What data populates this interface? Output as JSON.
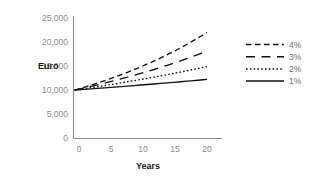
{
  "chart_data": {
    "type": "line",
    "title": "",
    "subtitle": "",
    "xlabel": "Years",
    "ylabel": "Euro",
    "x": [
      0,
      1,
      2,
      3,
      4,
      5,
      6,
      7,
      8,
      9,
      10,
      11,
      12,
      13,
      14,
      15,
      16,
      17,
      18,
      19,
      20
    ],
    "xlim": [
      0,
      20
    ],
    "ylim": [
      0,
      25000
    ],
    "x_ticks": [
      0,
      5,
      10,
      15,
      20
    ],
    "x_tick_labels": [
      "0",
      "5",
      "10",
      "15",
      "20"
    ],
    "y_ticks": [
      0,
      5000,
      10000,
      15000,
      20000,
      25000
    ],
    "y_tick_labels": [
      "0",
      "5,000",
      "10,000",
      "15,000",
      "20,000",
      "25,000"
    ],
    "grid": false,
    "legend_position": "right",
    "series": [
      {
        "name": "4%",
        "line_style": "dashed",
        "color": "#111111",
        "values": [
          10000,
          10400,
          10816,
          11249,
          11699,
          12167,
          12653,
          13159,
          13686,
          14233,
          14802,
          15395,
          16010,
          16651,
          17317,
          18009,
          18730,
          19479,
          20258,
          21068,
          21911
        ]
      },
      {
        "name": "3%",
        "line_style": "long-dashed",
        "color": "#111111",
        "values": [
          10000,
          10300,
          10609,
          10927,
          11255,
          11593,
          11941,
          12299,
          12668,
          13048,
          13439,
          13842,
          14258,
          14685,
          15126,
          15580,
          16047,
          16528,
          17024,
          17535,
          18061
        ]
      },
      {
        "name": "2%",
        "line_style": "dotted",
        "color": "#111111",
        "values": [
          10000,
          10200,
          10404,
          10612,
          10824,
          11041,
          11262,
          11487,
          11717,
          11951,
          12190,
          12434,
          12682,
          12936,
          13195,
          13459,
          13728,
          14002,
          14282,
          14568,
          14859
        ]
      },
      {
        "name": "1%",
        "line_style": "solid",
        "color": "#111111",
        "values": [
          10000,
          10100,
          10201,
          10303,
          10406,
          10510,
          10615,
          10721,
          10829,
          10937,
          11046,
          11157,
          11268,
          11381,
          11495,
          11610,
          11726,
          11843,
          11961,
          12081,
          12202
        ]
      }
    ]
  },
  "legend": {
    "entries": [
      {
        "label": "4%",
        "style": "dashed"
      },
      {
        "label": "3%",
        "style": "long-dashed"
      },
      {
        "label": "2%",
        "style": "dotted"
      },
      {
        "label": "1%",
        "style": "solid"
      }
    ]
  }
}
